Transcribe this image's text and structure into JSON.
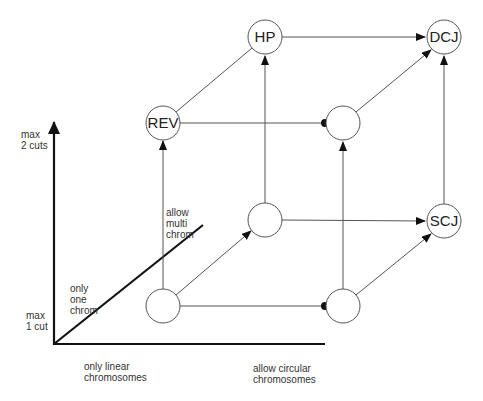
{
  "diagram": {
    "type": "cube-lattice",
    "nodes": [
      {
        "id": "rev",
        "label": "REV",
        "x": 163,
        "y": 123
      },
      {
        "id": "hp",
        "label": "HP",
        "x": 265,
        "y": 37
      },
      {
        "id": "dcj",
        "label": "DCJ",
        "x": 444,
        "y": 37
      },
      {
        "id": "circ2",
        "label": "",
        "x": 343,
        "y": 123
      },
      {
        "id": "lin1",
        "label": "",
        "x": 163,
        "y": 306
      },
      {
        "id": "multi1",
        "label": "",
        "x": 265,
        "y": 220
      },
      {
        "id": "scj",
        "label": "SCJ",
        "x": 444,
        "y": 221
      },
      {
        "id": "circ1",
        "label": "",
        "x": 343,
        "y": 306
      }
    ],
    "edges": [
      {
        "from": "lin1",
        "to": "rev",
        "head": "arrow"
      },
      {
        "from": "lin1",
        "to": "multi1",
        "head": "arrow"
      },
      {
        "from": "lin1",
        "to": "circ1",
        "head": "dot"
      },
      {
        "from": "rev",
        "to": "hp",
        "head": "none"
      },
      {
        "from": "rev",
        "to": "circ2",
        "head": "dot"
      },
      {
        "from": "multi1",
        "to": "hp",
        "head": "arrow"
      },
      {
        "from": "multi1",
        "to": "scj",
        "head": "arrow"
      },
      {
        "from": "hp",
        "to": "dcj",
        "head": "arrow"
      },
      {
        "from": "circ2",
        "to": "dcj",
        "head": "arrow"
      },
      {
        "from": "circ1",
        "to": "circ2",
        "head": "arrow"
      },
      {
        "from": "circ1",
        "to": "scj",
        "head": "arrow"
      },
      {
        "from": "scj",
        "to": "dcj",
        "head": "arrow"
      }
    ],
    "axes": {
      "vertical": {
        "top_label": "max\n2 cuts",
        "bottom_label": "max\n1 cut"
      },
      "horizontal": {
        "left_label": "only linear\nchromosomes",
        "right_label": "allow circular\nchromosomes"
      },
      "diagonal": {
        "low_label": "only\none\nchrom",
        "high_label": "allow\nmulti\nchrom"
      }
    }
  }
}
